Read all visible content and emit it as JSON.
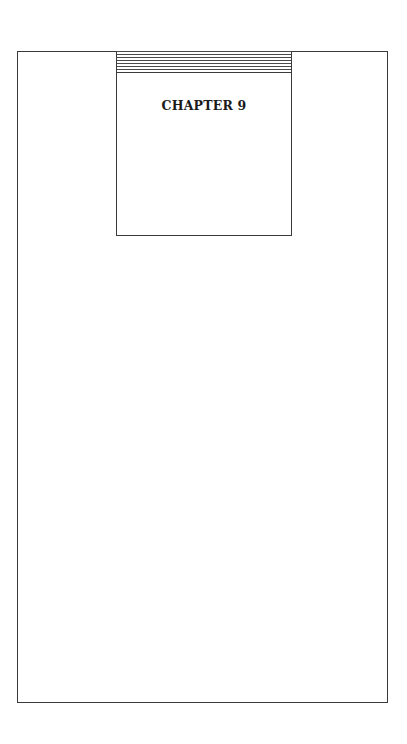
{
  "page": {
    "chapter_heading": "CHAPTER 9"
  },
  "colors": {
    "line": "#3a3a3a",
    "text": "#1a1a1a",
    "background": "#ffffff"
  }
}
